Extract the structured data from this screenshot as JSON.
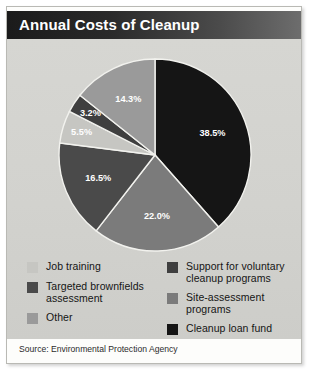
{
  "figure": {
    "title": "Annual Costs of Cleanup",
    "source": "Source: Environmental Protection Agency"
  },
  "colors": {
    "black": "#151515",
    "dark_gray": "#4a4a4a",
    "medium_gray": "#7b7b7b",
    "light_medium_gray": "#9a9a9a",
    "light_gray": "#c6c6c2",
    "panel_bg": "#d4d4d0",
    "title_bar_dark": "#1b1b1b",
    "title_bar_light": "#6e6e6e",
    "label_text": "#ffffff"
  },
  "chart_data": {
    "type": "pie",
    "title": "Annual Costs of Cleanup",
    "legend_position": "bottom",
    "start_angle_deg": 0,
    "direction": "clockwise",
    "categories": [
      "Cleanup loan fund",
      "Site-assessment programs",
      "Targeted brownfields assessment",
      "Other",
      "Support for voluntary cleanup programs",
      "Job training"
    ],
    "values": [
      38.5,
      22.0,
      16.5,
      5.5,
      3.2,
      14.3
    ],
    "labels": [
      "38.5%",
      "22.0%",
      "16.5%",
      "5.5%",
      "3.2%",
      "14.3%"
    ],
    "slice_colors": [
      "#151515",
      "#7b7b7b",
      "#4a4a4a",
      "#c6c6c2",
      "#3f3f3f",
      "#9a9a9a"
    ],
    "units": "percent",
    "total": 100.0
  },
  "legend": {
    "left_column": [
      {
        "label": "Job training",
        "color": "#c6c6c2"
      },
      {
        "label": "Targeted brownfields assessment",
        "color": "#4a4a4a"
      },
      {
        "label": "Other",
        "color": "#9a9a9a"
      }
    ],
    "right_column": [
      {
        "label": "Support for voluntary cleanup programs",
        "color": "#3f3f3f"
      },
      {
        "label": "Site-assessment programs",
        "color": "#7b7b7b"
      },
      {
        "label": "Cleanup loan fund",
        "color": "#151515"
      }
    ]
  }
}
